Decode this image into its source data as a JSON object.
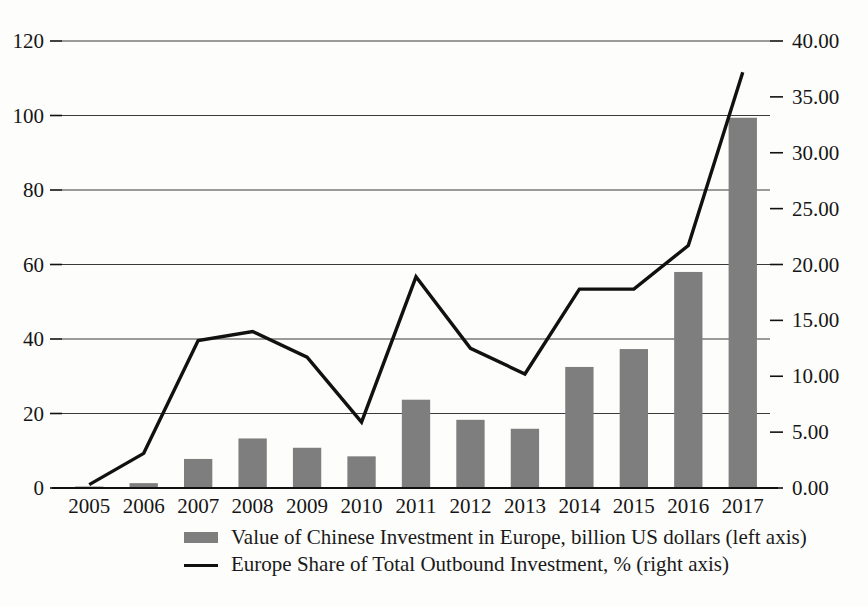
{
  "chart_data": {
    "type": "bar",
    "title": "",
    "subtitle": "",
    "xlabel": "",
    "categories": [
      "2005",
      "2006",
      "2007",
      "2008",
      "2009",
      "2010",
      "2011",
      "2012",
      "2013",
      "2014",
      "2015",
      "2016",
      "2017"
    ],
    "grid": true,
    "legend_position": "bottom",
    "left_axis": {
      "label": "Value of Chinese Investment in Europe, billion US dollars",
      "ylim": [
        0,
        120
      ],
      "ticks": [
        "0",
        "20",
        "40",
        "60",
        "80",
        "100",
        "120"
      ],
      "tick_values": [
        0,
        20,
        40,
        60,
        80,
        100,
        120
      ]
    },
    "right_axis": {
      "label": "Europe Share of Total Outbound Investment, %",
      "ylim": [
        0,
        40
      ],
      "ticks": [
        "0.00",
        "5.00",
        "10.00",
        "15.00",
        "20.00",
        "25.00",
        "30.00",
        "35.00",
        "40.00"
      ],
      "tick_values": [
        0,
        5,
        10,
        15,
        20,
        25,
        30,
        35,
        40
      ]
    },
    "series": [
      {
        "name": "Value of Chinese Investment in Europe, billion US dollars (left axis)",
        "type": "bar",
        "axis": "left",
        "color": "#7e7e7e",
        "values": [
          0.4,
          1.3,
          7.8,
          13.3,
          10.8,
          8.5,
          23.7,
          18.3,
          15.9,
          32.5,
          37.3,
          58.0,
          99.4
        ]
      },
      {
        "name": "Europe Share of Total Outbound Investment, % (right axis)",
        "type": "line",
        "axis": "right",
        "color": "#111111",
        "values": [
          0.3,
          3.1,
          13.2,
          14.0,
          11.7,
          5.9,
          18.9,
          12.5,
          10.2,
          17.8,
          17.8,
          21.7,
          37.2
        ]
      }
    ]
  },
  "legend": {
    "entries": [
      {
        "marker": "bar-swatch",
        "label": "Value of Chinese Investment in Europe, billion US dollars (left axis)"
      },
      {
        "marker": "line-swatch",
        "label": "Europe Share of Total Outbound Investment, % (right axis)"
      }
    ]
  }
}
